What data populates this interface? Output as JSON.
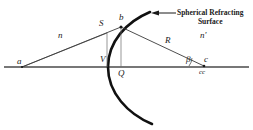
{
  "figure": {
    "title_callout": {
      "line1": "Spherical Refracting",
      "line2": "Surface"
    },
    "colors": {
      "ink": "#1a1a1a",
      "axis": "#555555",
      "surface": "#111111",
      "background": "#ffffff"
    },
    "labels": {
      "object_point": "a",
      "index_left": "n",
      "aux_point": "S",
      "surface_point": "b",
      "vertex": "V",
      "foot_point": "Q",
      "radius": "R",
      "index_right": "n'",
      "angle_beta": "β",
      "center_point": "c",
      "center_sub": "cc"
    },
    "geometry": {
      "axis_y": 67,
      "axis_x_start": 4,
      "axis_x_end": 249,
      "point_a": [
        22,
        67
      ],
      "point_S": [
        107,
        31
      ],
      "point_b": [
        121,
        27
      ],
      "point_V": [
        110,
        67
      ],
      "point_Q": [
        121,
        67
      ],
      "point_c": [
        204,
        66
      ],
      "arc_top": [
        150,
        12
      ],
      "arc_bottom": [
        152,
        124
      ],
      "callout_arrow_tip": [
        152,
        13
      ],
      "callout_arrow_tail": [
        176,
        13
      ]
    }
  }
}
